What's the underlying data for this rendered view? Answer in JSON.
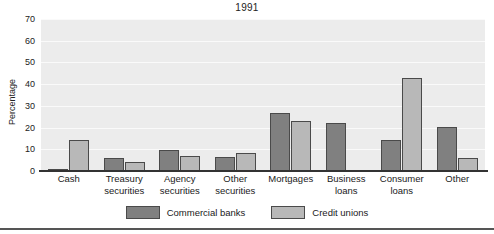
{
  "chart_data": {
    "type": "bar",
    "title": "1991",
    "xlabel": "",
    "ylabel": "Percentage",
    "ylim": [
      0,
      70
    ],
    "yticks": [
      0,
      10,
      20,
      30,
      40,
      50,
      60,
      70
    ],
    "grid": true,
    "legend_position": "bottom",
    "categories": [
      "Cash",
      "Treasury securities",
      "Agency securities",
      "Other securities",
      "Mortgages",
      "Business loans",
      "Consumer loans",
      "Other"
    ],
    "category_lines": [
      [
        "Cash"
      ],
      [
        "Treasury",
        "securities"
      ],
      [
        "Agency",
        "securities"
      ],
      [
        "Other",
        "securities"
      ],
      [
        "Mortgages"
      ],
      [
        "Business",
        "loans"
      ],
      [
        "Consumer",
        "loans"
      ],
      [
        "Other"
      ]
    ],
    "series": [
      {
        "name": "Commercial banks",
        "color": "#808080",
        "values": [
          1,
          6,
          9.5,
          6.5,
          26.5,
          22,
          14.5,
          20.5
        ]
      },
      {
        "name": "Credit unions",
        "color": "#b8b8b8",
        "values": [
          14.5,
          4,
          7,
          8.5,
          23,
          0,
          43,
          6
        ]
      }
    ]
  },
  "legend": {
    "items": [
      {
        "label": "Commercial banks"
      },
      {
        "label": "Credit unions"
      }
    ]
  }
}
